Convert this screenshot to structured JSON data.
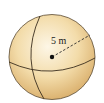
{
  "diagram": {
    "shape": "sphere",
    "radius_label": "5 m",
    "radius_value": 5,
    "radius_unit": "m",
    "colors": {
      "fill_light": "#fbf0d8",
      "fill_mid": "#f2d9a6",
      "fill_dark": "#d9ae6a",
      "outline": "#3a2e1e"
    }
  }
}
